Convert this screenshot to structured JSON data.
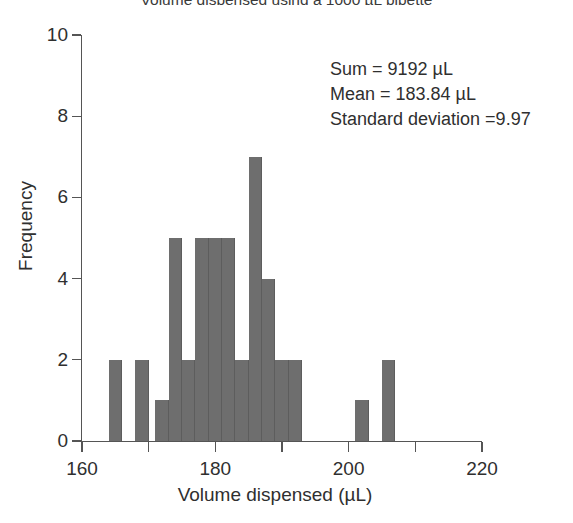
{
  "chart_data": {
    "type": "bar",
    "title": "Volume dispensed using a 1000 µL pipette",
    "xlabel": "Volume dispensed (µL)",
    "ylabel": "Frequency",
    "xlim": [
      160,
      220
    ],
    "ylim": [
      0,
      10
    ],
    "grid": false,
    "legend": null,
    "bar_color": "#6e6e6e",
    "bin_width": 2,
    "x_ticks": [
      160,
      170,
      180,
      190,
      200,
      210,
      220
    ],
    "x_tick_labels": [
      "160",
      "",
      "180",
      "",
      "200",
      "",
      "220"
    ],
    "y_ticks": [
      0,
      2,
      4,
      6,
      8,
      10
    ],
    "y_tick_labels": [
      "0",
      "2",
      "4",
      "6",
      "8",
      "10"
    ],
    "bins": [
      {
        "start": 164,
        "end": 166,
        "count": 2
      },
      {
        "start": 168,
        "end": 170,
        "count": 2
      },
      {
        "start": 171,
        "end": 173,
        "count": 1
      },
      {
        "start": 173,
        "end": 175,
        "count": 5
      },
      {
        "start": 175,
        "end": 177,
        "count": 2
      },
      {
        "start": 177,
        "end": 179,
        "count": 5
      },
      {
        "start": 179,
        "end": 181,
        "count": 5
      },
      {
        "start": 181,
        "end": 183,
        "count": 5
      },
      {
        "start": 183,
        "end": 185,
        "count": 2
      },
      {
        "start": 185,
        "end": 187,
        "count": 7
      },
      {
        "start": 187,
        "end": 189,
        "count": 4
      },
      {
        "start": 189,
        "end": 191,
        "count": 2
      },
      {
        "start": 191,
        "end": 193,
        "count": 2
      },
      {
        "start": 201,
        "end": 203,
        "count": 1
      },
      {
        "start": 205,
        "end": 207,
        "count": 2
      }
    ],
    "annotations": {
      "sum": "Sum = 9192 µL",
      "mean": "Mean = 183.84 µL",
      "std": "Standard deviation =9.97"
    }
  }
}
